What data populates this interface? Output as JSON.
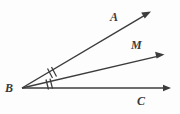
{
  "figure": {
    "background_color": "#fdfdfd",
    "line_color": "#3c3c3c",
    "label_color": "#3a3a3a",
    "vertex": {
      "name": "B",
      "label": "B",
      "x": 22,
      "y": 88
    },
    "rays": [
      {
        "id": "ray-a",
        "label": "A",
        "from_x": 22,
        "from_y": 88,
        "to_x": 150,
        "to_y": 12,
        "label_x": 110,
        "label_y": 11,
        "has_arrowhead": true
      },
      {
        "id": "ray-m",
        "label": "M",
        "from_x": 22,
        "from_y": 88,
        "to_x": 163,
        "to_y": 55,
        "label_x": 131,
        "label_y": 39,
        "has_arrowhead": true
      },
      {
        "id": "ray-c",
        "label": "C",
        "from_x": 22,
        "from_y": 88,
        "to_x": 170,
        "to_y": 88,
        "label_x": 137,
        "label_y": 95,
        "has_arrowhead": true
      }
    ],
    "angle_marks": [
      {
        "id": "angle-abm",
        "name": "angle-ABM",
        "tick_count": 2,
        "between": [
          "A",
          "M"
        ]
      },
      {
        "id": "angle-mbc",
        "name": "angle-MBC",
        "tick_count": 2,
        "between": [
          "M",
          "C"
        ]
      }
    ]
  }
}
